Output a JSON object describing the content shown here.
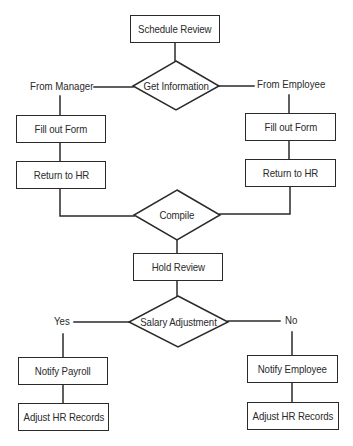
{
  "diagram": {
    "type": "flowchart",
    "stroke_color": "#2a2a2a",
    "background": "#ffffff",
    "nodes": {
      "schedule_review": {
        "label": "Schedule Review",
        "shape": "rectangle"
      },
      "get_information": {
        "label": "Get Information",
        "shape": "diamond"
      },
      "fill_out_form_manager": {
        "label": "Fill out Form",
        "shape": "rectangle"
      },
      "return_to_hr_manager": {
        "label": "Return to HR",
        "shape": "rectangle"
      },
      "fill_out_form_employee": {
        "label": "Fill out Form",
        "shape": "rectangle"
      },
      "return_to_hr_employee": {
        "label": "Return to HR",
        "shape": "rectangle"
      },
      "compile": {
        "label": "Compile",
        "shape": "diamond"
      },
      "hold_review": {
        "label": "Hold Review",
        "shape": "rectangle"
      },
      "salary_adjustment": {
        "label": "Salary Adjustment",
        "shape": "diamond"
      },
      "notify_payroll": {
        "label": "Notify Payroll",
        "shape": "rectangle"
      },
      "adjust_hr_records_yes": {
        "label": "Adjust HR Records",
        "shape": "rectangle"
      },
      "notify_employee": {
        "label": "Notify Employee",
        "shape": "rectangle"
      },
      "adjust_hr_records_no": {
        "label": "Adjust HR Records",
        "shape": "rectangle"
      }
    },
    "edge_labels": {
      "from_manager": "From Manager",
      "from_employee": "From Employee",
      "yes": "Yes",
      "no": "No"
    },
    "edges": [
      {
        "from": "Schedule Review",
        "to": "Get Information"
      },
      {
        "from": "Get Information",
        "to": "Fill out Form (Manager)",
        "label": "From Manager"
      },
      {
        "from": "Get Information",
        "to": "Fill out Form (Employee)",
        "label": "From Employee"
      },
      {
        "from": "Fill out Form (Manager)",
        "to": "Return to HR (Manager)"
      },
      {
        "from": "Fill out Form (Employee)",
        "to": "Return to HR (Employee)"
      },
      {
        "from": "Return to HR (Manager)",
        "to": "Compile"
      },
      {
        "from": "Return to HR (Employee)",
        "to": "Compile"
      },
      {
        "from": "Compile",
        "to": "Hold Review"
      },
      {
        "from": "Hold Review",
        "to": "Salary Adjustment"
      },
      {
        "from": "Salary Adjustment",
        "to": "Notify Payroll",
        "label": "Yes"
      },
      {
        "from": "Salary Adjustment",
        "to": "Notify Employee",
        "label": "No"
      },
      {
        "from": "Notify Payroll",
        "to": "Adjust HR Records (Yes)"
      },
      {
        "from": "Notify Employee",
        "to": "Adjust HR Records (No)"
      }
    ]
  }
}
